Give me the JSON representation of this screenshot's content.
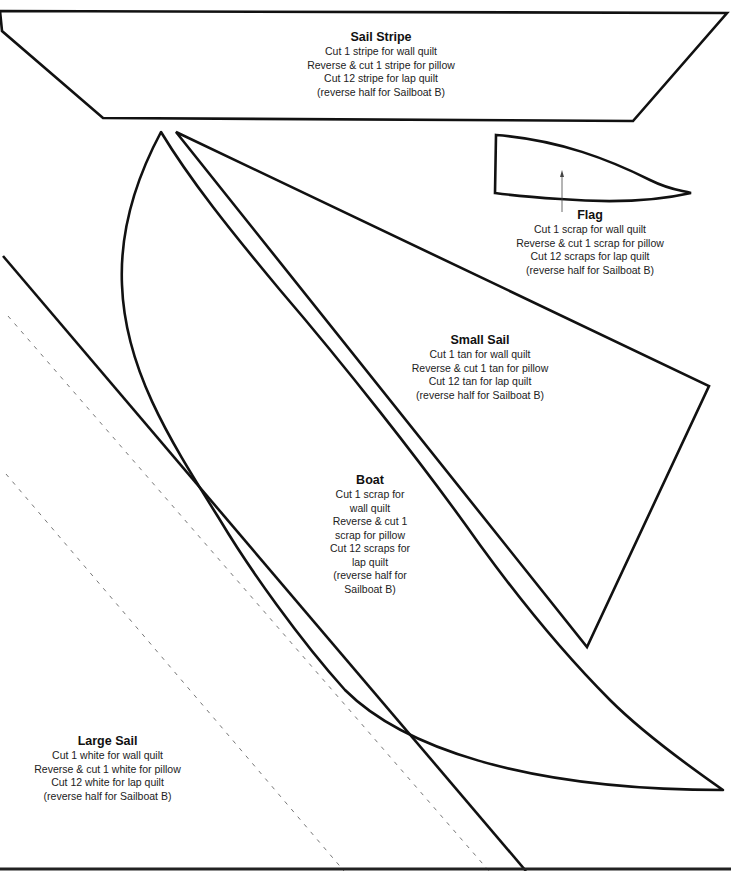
{
  "page": {
    "type": "quilt pattern template sheet",
    "line_color": "#111111",
    "dash_color": "#777777"
  },
  "pieces": [
    {
      "id": "sail_stripe",
      "title": "Sail Stripe",
      "lines": [
        "Cut 1 stripe for wall quilt",
        "Reverse & cut 1 stripe for pillow",
        "Cut 12 stripe for lap quilt",
        "(reverse half for Sailboat B)"
      ]
    },
    {
      "id": "flag",
      "title": "Flag",
      "lines": [
        "Cut 1 scrap for wall quilt",
        "Reverse & cut 1 scrap for pillow",
        "Cut 12 scraps for lap quilt",
        "(reverse half for Sailboat B)"
      ]
    },
    {
      "id": "small_sail",
      "title": "Small Sail",
      "lines": [
        "Cut 1 tan for wall quilt",
        "Reverse & cut 1 tan for pillow",
        "Cut 12 tan for lap quilt",
        "(reverse half for Sailboat B)"
      ]
    },
    {
      "id": "boat",
      "title": "Boat",
      "lines": [
        "Cut 1 scrap for",
        "wall quilt",
        "Reverse & cut 1",
        "scrap for pillow",
        "Cut 12 scraps for",
        "lap quilt",
        "(reverse half for",
        "Sailboat B)"
      ]
    },
    {
      "id": "large_sail",
      "title": "Large Sail",
      "lines": [
        "Cut 1 white for wall quilt",
        "Reverse & cut 1 white for pillow",
        "Cut 12 white for lap quilt",
        "(reverse half for Sailboat B)"
      ]
    }
  ]
}
